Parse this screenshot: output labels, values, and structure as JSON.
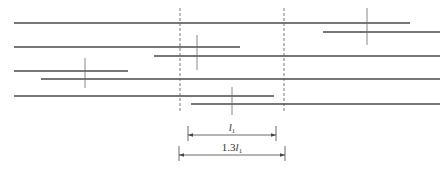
{
  "caption": "",
  "colors": {
    "bar": "#4a4a4a",
    "tick": "#6a6a6a",
    "dash": "#555555",
    "dim": "#444444"
  },
  "bars": [
    {
      "x1": 14,
      "x2": 410,
      "y": 23
    },
    {
      "x1": 323,
      "x2": 440,
      "y": 32
    },
    {
      "x1": 14,
      "x2": 240,
      "y": 47
    },
    {
      "x1": 154,
      "x2": 440,
      "y": 56
    },
    {
      "x1": 14,
      "x2": 128,
      "y": 71
    },
    {
      "x1": 41,
      "x2": 440,
      "y": 79
    },
    {
      "x1": 14,
      "x2": 274,
      "y": 96
    },
    {
      "x1": 191,
      "x2": 440,
      "y": 104
    }
  ],
  "splice_ticks": [
    {
      "x": 367,
      "y1": 8,
      "y2": 45
    },
    {
      "x": 197,
      "y1": 35,
      "y2": 70
    },
    {
      "x": 85,
      "y1": 58,
      "y2": 88
    },
    {
      "x": 232,
      "y1": 87,
      "y2": 115
    }
  ],
  "dashed_lines": [
    {
      "x": 180,
      "y1": 8,
      "y2": 113
    },
    {
      "x": 284,
      "y1": 8,
      "y2": 113
    }
  ],
  "dimensions": [
    {
      "x1": 188,
      "x2": 276,
      "y": 135,
      "label_main": "l",
      "label_sub": "1",
      "label_prefix": ""
    },
    {
      "x1": 179,
      "x2": 285,
      "y": 155,
      "label_main": "l",
      "label_sub": "1",
      "label_prefix": "1.3"
    }
  ]
}
